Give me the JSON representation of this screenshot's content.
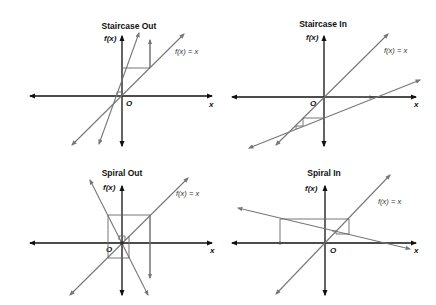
{
  "panels": [
    {
      "title": "Staircase Out",
      "y_label": "f(x)",
      "x_label": "x",
      "origin_label": "O",
      "identity_label": "f(x) = x"
    },
    {
      "title": "Staircase In",
      "y_label": "f(x)",
      "x_label": "x",
      "origin_label": "O",
      "identity_label": "f(x) = x"
    },
    {
      "title": "Spiral Out",
      "y_label": "f(x)",
      "x_label": "x",
      "origin_label": "O",
      "identity_label": "f(x) = x"
    },
    {
      "title": "Spiral In",
      "y_label": "f(x)",
      "x_label": "x",
      "origin_label": "O",
      "identity_label": "f(x) = x"
    }
  ],
  "colors": {
    "axis": "#111111",
    "lines": "#777777",
    "background": "#ffffff"
  }
}
